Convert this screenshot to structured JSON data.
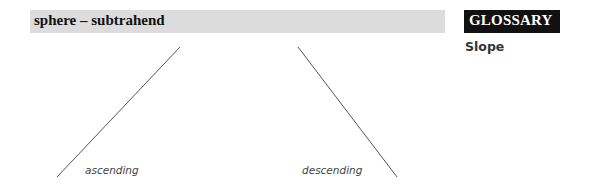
{
  "header": {
    "title": "sphere – subtrahend",
    "background": "#dcdcdc"
  },
  "glossary": {
    "title": "GLOSSARY",
    "background": "#111111",
    "terms": [
      {
        "label": "Slope"
      }
    ]
  },
  "diagram": {
    "line_color": "#555555",
    "lines": [
      {
        "name": "ascending",
        "label": "ascending",
        "x1": 57,
        "y1": 177,
        "x2": 180,
        "y2": 47
      },
      {
        "name": "descending",
        "label": "descending",
        "x1": 298,
        "y1": 47,
        "x2": 397,
        "y2": 177
      }
    ]
  }
}
